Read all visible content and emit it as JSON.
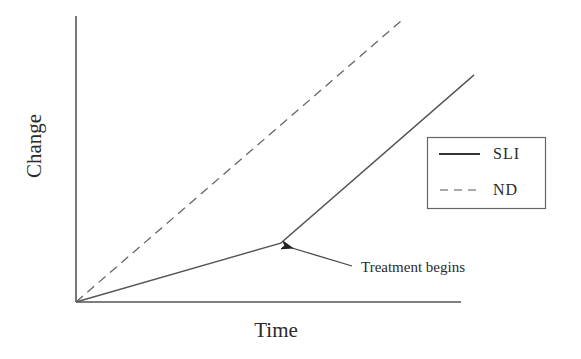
{
  "chart_data": {
    "type": "line",
    "title": "",
    "xlabel": "Time",
    "ylabel": "Change",
    "xlim": [
      0,
      10
    ],
    "ylim": [
      0,
      10
    ],
    "grid": false,
    "ticks": false,
    "legend_position": "right",
    "series": [
      {
        "name": "SLI",
        "style": "solid",
        "color": "#555555",
        "points": [
          [
            0,
            0
          ],
          [
            5.32,
            2.06
          ],
          [
            10.34,
            7.94
          ]
        ]
      },
      {
        "name": "ND",
        "style": "dashed",
        "color": "#666666",
        "points": [
          [
            0,
            0
          ],
          [
            8.47,
            9.86
          ]
        ]
      }
    ],
    "annotations": [
      {
        "text": "Treatment begins",
        "arrow_to": [
          5.32,
          2.06
        ]
      }
    ]
  },
  "labels": {
    "x_axis": "Time",
    "y_axis": "Change",
    "legend": [
      {
        "label": "SLI",
        "style": "solid"
      },
      {
        "label": "ND",
        "style": "dashed"
      }
    ],
    "annotation": "Treatment begins"
  },
  "colors": {
    "axis": "#555555",
    "line": "#5a5a5a",
    "text": "#2a2a2a",
    "background": "#ffffff"
  }
}
